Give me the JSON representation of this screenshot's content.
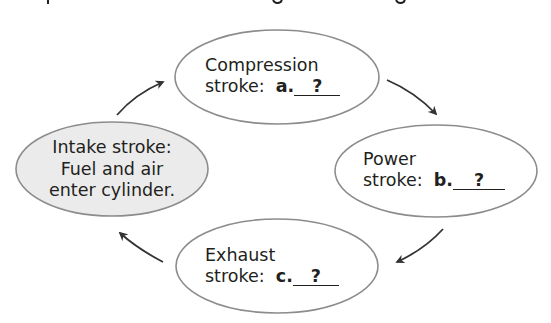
{
  "diagram": {
    "type": "cycle",
    "colors": {
      "outline": "#8c8c8c",
      "arrow": "#333333",
      "text": "#231f20",
      "highlight_fill": "#ebebeb",
      "default_fill": "#ffffff"
    },
    "nodes": [
      {
        "id": "compression",
        "line1": "Compression",
        "line2_prefix": "stroke:",
        "label": "a.",
        "blank": "?"
      },
      {
        "id": "power",
        "line1": "Power",
        "line2_prefix": "stroke:",
        "label": "b.",
        "blank": "?"
      },
      {
        "id": "exhaust",
        "line1": "Exhaust",
        "line2_prefix": "stroke:",
        "label": "c.",
        "blank": "?"
      },
      {
        "id": "intake",
        "line1": "Intake stroke:",
        "line2": "Fuel and air",
        "line3": "enter cylinder."
      }
    ],
    "edges": [
      {
        "from": "intake",
        "to": "compression"
      },
      {
        "from": "compression",
        "to": "power"
      },
      {
        "from": "power",
        "to": "exhaust"
      },
      {
        "from": "exhaust",
        "to": "intake"
      }
    ]
  }
}
